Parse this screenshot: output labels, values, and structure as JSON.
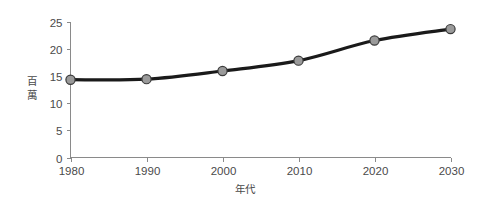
{
  "chart_data": {
    "type": "line",
    "title": "",
    "subtitle": "",
    "xlabel": "年代",
    "ylabel": "百萬",
    "ylabel_chars": [
      "百",
      "萬"
    ],
    "categories": [
      "1980",
      "1990",
      "2000",
      "2010",
      "2020",
      "2030"
    ],
    "x": [
      1980,
      1990,
      2000,
      2010,
      2020,
      2030
    ],
    "values": [
      14.3,
      14.4,
      15.9,
      17.8,
      21.5,
      23.6
    ],
    "series": [
      {
        "name": "",
        "values": [
          14.3,
          14.4,
          15.9,
          17.8,
          21.5,
          23.6
        ]
      }
    ],
    "ylim": [
      0,
      25
    ],
    "xlim": [
      1980,
      2030
    ],
    "yticks": [
      "0",
      "5",
      "10",
      "15",
      "20",
      "25"
    ],
    "ytick_values": [
      0,
      5,
      10,
      15,
      20,
      25
    ],
    "xticks": [
      "1980",
      "1990",
      "2000",
      "2010",
      "2020",
      "2030"
    ],
    "grid": false,
    "legend": false,
    "legend_position": "none",
    "colors": {
      "line": "#1a1a1a",
      "marker_fill": "#9a9a9a",
      "marker_stroke": "#3a3a3a",
      "axis": "#8a8a8a",
      "text": "#4a4a4a",
      "background": "#ffffff"
    }
  }
}
